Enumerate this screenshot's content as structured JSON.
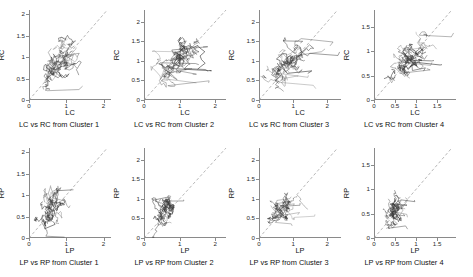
{
  "figure": {
    "layout": "2 rows x 4 columns of scatter/trajectory subplots",
    "background_color": "#ffffff",
    "trace_color": "#3a3a3a",
    "reference_line_color": "#9a9a9a",
    "axis_color": "#8a8a8a"
  },
  "chart_data": [
    {
      "type": "scatter",
      "title": "LC vs RC from Cluster 1",
      "xlabel": "LC",
      "ylabel": "RC",
      "xlim": [
        0,
        2.2
      ],
      "ylim": [
        0,
        2.1
      ],
      "xticks": [
        0,
        1,
        2
      ],
      "yticks": [
        0,
        0.5,
        1,
        1.5,
        2
      ],
      "xticklabels": [
        "0",
        "1",
        "2"
      ],
      "yticklabels": [
        "0",
        "0.5",
        "1",
        "1.5",
        "2"
      ],
      "grid": false,
      "legend": "none",
      "reference_line": "y = x (dashed)",
      "description": "Dense connected-line cloud along the identity line, centered near (0.8, 0.85), spanning roughly x 0.3-1.5 and y 0.3-1.5",
      "cloud_center": [
        0.8,
        0.85
      ],
      "cloud_spread": [
        0.55,
        0.55
      ]
    },
    {
      "type": "scatter",
      "title": "LC vs RC from Cluster 2",
      "xlabel": "LC",
      "ylabel": "RC",
      "xlim": [
        0,
        2.3
      ],
      "ylim": [
        0,
        2.3
      ],
      "xticks": [
        0,
        1,
        2
      ],
      "yticks": [
        0,
        0.5,
        1,
        1.5,
        2
      ],
      "xticklabels": [
        "0",
        "1",
        "2"
      ],
      "yticklabels": [
        "0",
        "0.5",
        "1",
        "1.5",
        "2"
      ],
      "grid": false,
      "legend": "none",
      "reference_line": "y = x (dashed)",
      "description": "Elongated connected-line cloud along the identity line with long excursions to x about 2.1, centered near (0.95, 0.95)",
      "cloud_center": [
        0.95,
        0.95
      ],
      "cloud_spread": [
        0.7,
        0.6
      ]
    },
    {
      "type": "scatter",
      "title": "LC vs RC from Cluster 3",
      "xlabel": "LC",
      "ylabel": "RC",
      "xlim": [
        0,
        2.4
      ],
      "ylim": [
        0,
        2.3
      ],
      "xticks": [
        0,
        1,
        2
      ],
      "yticks": [
        0,
        0.5,
        1,
        1.5,
        2
      ],
      "xticklabels": [
        "0",
        "1",
        "2"
      ],
      "yticklabels": [
        "0",
        "0.5",
        "1",
        "1.5",
        "2"
      ],
      "grid": false,
      "legend": "none",
      "reference_line": "y = x (dashed)",
      "description": "Dense cloud hugging the identity line from 0.2 to 1.5 with a few long segments reaching x about 2.1",
      "cloud_center": [
        0.85,
        0.9
      ],
      "cloud_spread": [
        0.6,
        0.55
      ]
    },
    {
      "type": "scatter",
      "title": "LC vs RC from Cluster 4",
      "xlabel": "LC",
      "ylabel": "RC",
      "xlim": [
        0,
        1.95
      ],
      "ylim": [
        0,
        1.85
      ],
      "xticks": [
        0,
        0.5,
        1,
        1.5
      ],
      "yticks": [
        0,
        0.5,
        1,
        1.5
      ],
      "xticklabels": [
        "0",
        "0.5",
        "1",
        "1.5"
      ],
      "yticklabels": [
        "0",
        "0.5",
        "1",
        "1.5"
      ],
      "grid": false,
      "legend": "none",
      "reference_line": "y = x (dashed)",
      "description": "Dense cloud centered near (0.8, 0.8) with several long flat segments extending right toward x about 1.6",
      "cloud_center": [
        0.8,
        0.8
      ],
      "cloud_spread": [
        0.5,
        0.45
      ]
    },
    {
      "type": "scatter",
      "title": "LP vs RP from Cluster 1",
      "xlabel": "LP",
      "ylabel": "RP",
      "xlim": [
        0,
        2.2
      ],
      "ylim": [
        0,
        2.1
      ],
      "xticks": [
        0,
        1,
        2
      ],
      "yticks": [
        0,
        0.5,
        1,
        1.5,
        2
      ],
      "xticklabels": [
        "0",
        "1",
        "2"
      ],
      "yticklabels": [
        "0",
        "0.5",
        "1",
        "1.5",
        "2"
      ],
      "grid": false,
      "legend": "none",
      "reference_line": "y = x (dashed)",
      "description": "Tight steep cloud left of the identity line, centered near (0.6, 0.65), with horizontal arrow-like segments pointing left from x about 1.3",
      "cloud_center": [
        0.6,
        0.65
      ],
      "cloud_spread": [
        0.35,
        0.45
      ]
    },
    {
      "type": "scatter",
      "title": "LP vs RP from Cluster 2",
      "xlabel": "LP",
      "ylabel": "RP",
      "xlim": [
        0,
        2.3
      ],
      "ylim": [
        0,
        2.3
      ],
      "xticks": [
        0,
        1,
        2
      ],
      "yticks": [
        0,
        0.5,
        1,
        1.5,
        2
      ],
      "xticklabels": [
        "0",
        "1",
        "2"
      ],
      "yticklabels": [
        "0",
        "0.5",
        "1",
        "1.5",
        "2"
      ],
      "grid": false,
      "legend": "none",
      "reference_line": "y = x (dashed)",
      "description": "Vertically elongated cloud left of the identity line, centered near (0.6, 0.75), reaching y about 1.5",
      "cloud_center": [
        0.6,
        0.75
      ],
      "cloud_spread": [
        0.35,
        0.5
      ]
    },
    {
      "type": "scatter",
      "title": "LP vs RP from Cluster 3",
      "xlabel": "LP",
      "ylabel": "RP",
      "xlim": [
        0,
        2.4
      ],
      "ylim": [
        0,
        2.3
      ],
      "xticks": [
        0,
        1,
        2
      ],
      "yticks": [
        0,
        0.5,
        1,
        1.5,
        2
      ],
      "xticklabels": [
        "0",
        "1",
        "2"
      ],
      "yticklabels": [
        "0",
        "0.5",
        "1",
        "1.5",
        "2"
      ],
      "grid": false,
      "legend": "none",
      "reference_line": "y = x (dashed)",
      "description": "Round dense cloud centered near (0.7, 0.75) left of the identity line, with a few segments reaching x about 1.7",
      "cloud_center": [
        0.7,
        0.75
      ],
      "cloud_spread": [
        0.4,
        0.4
      ]
    },
    {
      "type": "scatter",
      "title": "LP vs RP from Cluster 4",
      "xlabel": "LP",
      "ylabel": "RP",
      "xlim": [
        0,
        1.95
      ],
      "ylim": [
        0,
        1.85
      ],
      "xticks": [
        0,
        0.5,
        1,
        1.5
      ],
      "yticks": [
        0,
        0.5,
        1,
        1.5
      ],
      "xticklabels": [
        "0",
        "0.5",
        "1",
        "1.5"
      ],
      "yticklabels": [
        "0",
        "0.5",
        "1",
        "1.5"
      ],
      "grid": false,
      "legend": "none",
      "reference_line": "y = x (dashed)",
      "description": "Narrow steep cloud hugging small values, centered near (0.45, 0.5), with short segments extending right to x about 1.0",
      "cloud_center": [
        0.45,
        0.5
      ],
      "cloud_spread": [
        0.3,
        0.35
      ]
    }
  ]
}
